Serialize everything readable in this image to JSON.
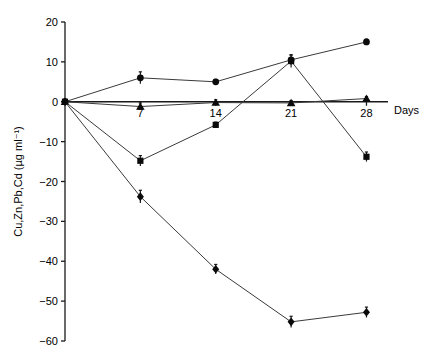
{
  "chart_data": {
    "type": "line",
    "title": "",
    "subtitle": "",
    "xlabel": "Days",
    "ylabel": "Cu,Zn,Pb,Cd (µg ml⁻¹)",
    "x": [
      0,
      7,
      14,
      21,
      28
    ],
    "xlim": [
      0,
      30
    ],
    "ylim": [
      -60,
      20
    ],
    "xticks": [
      7,
      14,
      21,
      28
    ],
    "xtick_labels": [
      "7",
      "14",
      "21",
      "28"
    ],
    "yticks": [
      20,
      10,
      0,
      -10,
      -20,
      -30,
      -40,
      -50,
      -60
    ],
    "ytick_labels": [
      "20",
      "10",
      "0",
      "−10",
      "−20",
      "−30",
      "−40",
      "−50",
      "−60"
    ],
    "grid": false,
    "legend": "none",
    "axis_at_zero": true,
    "series": [
      {
        "name": "Cu",
        "marker": "circle",
        "values": [
          0,
          6,
          5,
          10.5,
          15
        ],
        "errors": [
          0,
          1.5,
          0.6,
          1.2,
          0.7
        ]
      },
      {
        "name": "Zn",
        "marker": "triangle",
        "values": [
          0,
          -1.2,
          -0.2,
          -0.3,
          0.8
        ],
        "errors": [
          0,
          0.9,
          0.7,
          0.6,
          0.5
        ]
      },
      {
        "name": "Pb",
        "marker": "square",
        "values": [
          0,
          -14.8,
          -5.8,
          10.2,
          -13.8
        ],
        "errors": [
          0,
          1.3,
          0.7,
          1.6,
          1.2
        ]
      },
      {
        "name": "Cd",
        "marker": "diamond",
        "values": [
          0,
          -23.8,
          -42.0,
          -55.2,
          -52.8
        ],
        "errors": [
          0,
          1.6,
          1.2,
          1.4,
          1.3
        ]
      }
    ]
  }
}
